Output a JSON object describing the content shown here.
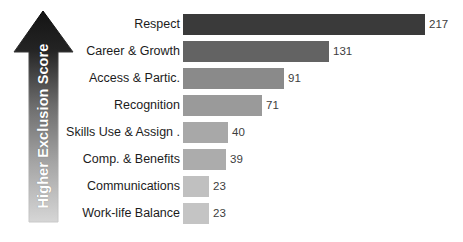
{
  "chart_data": {
    "type": "bar",
    "orientation": "horizontal",
    "title": "",
    "xlabel": "",
    "ylabel": "Higher Exclusion Score",
    "categories": [
      "Respect",
      "Career & Growth",
      "Access & Partic.",
      "Recognition",
      "Skills Use & Assign .",
      "Comp. & Benefits",
      "Communications",
      "Work-life Balance"
    ],
    "values": [
      217,
      131,
      91,
      71,
      40,
      39,
      23,
      23
    ],
    "value_labels": [
      "217",
      "131",
      "91",
      "71",
      "40",
      "39",
      "23",
      "23"
    ],
    "bar_colors": [
      "#3a3a3a",
      "#636363",
      "#8a8a8a",
      "#9a9a9a",
      "#a8a8a8",
      "#acacac",
      "#c0c0c0",
      "#c4c4c4"
    ],
    "xlim": [
      0,
      217
    ],
    "grid": false,
    "legend": null,
    "background": "#ffffff",
    "label_color": "#1c1c1c",
    "value_color": "#3d3d3d"
  },
  "axis_annotation": {
    "caption": "Higher Exclusion Score",
    "direction": "up",
    "gradient_top_color": "#1a1a1a",
    "gradient_bottom_color": "#d2d2d2",
    "text_color": "#ffffff"
  }
}
